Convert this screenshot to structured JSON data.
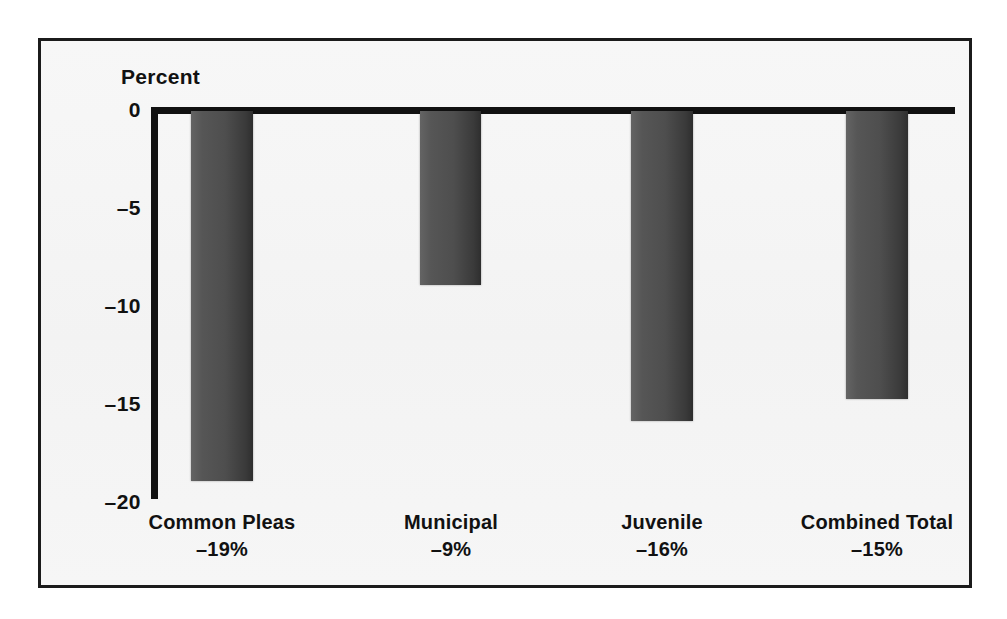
{
  "figure": {
    "frame_color": "#1b1b1b",
    "background_color": "#f5f5f5",
    "bar_color": "#4e4e4e"
  },
  "chart_data": {
    "type": "bar",
    "title": "",
    "subtitle": "",
    "axis_caption": "Percent",
    "xlabel": "",
    "ylabel": "Percent",
    "orientation": "vertical",
    "grid": false,
    "legend": false,
    "legend_position": "none",
    "ylim": [
      -20,
      0
    ],
    "yticks": [
      0,
      -5,
      -10,
      -15,
      -20
    ],
    "ytick_labels": [
      "0",
      "–5",
      "–10",
      "–15",
      "–20"
    ],
    "categories": [
      "Common Pleas",
      "Municipal",
      "Juvenile",
      "Combined Total"
    ],
    "values": [
      -18.9,
      -8.9,
      -15.8,
      -14.7
    ],
    "data_labels": [
      "–19%",
      "–9%",
      "–16%",
      "–15%"
    ],
    "bars": [
      {
        "category": "Common Pleas",
        "value": -18.9,
        "label": "–19%"
      },
      {
        "category": "Municipal",
        "value": -8.9,
        "label": "–9%"
      },
      {
        "category": "Juvenile",
        "value": -15.8,
        "label": "–16%"
      },
      {
        "category": "Combined Total",
        "value": -14.7,
        "label": "–15%"
      }
    ]
  }
}
